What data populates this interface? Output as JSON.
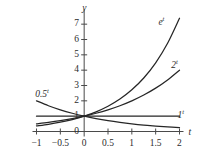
{
  "chart_data": {
    "type": "line",
    "title": "",
    "subtitle": "",
    "xlabel": "t",
    "ylabel": "y",
    "xlim": [
      -1,
      2
    ],
    "ylim": [
      0,
      7.5
    ],
    "grid": false,
    "legend_position": "inline-curve-labels",
    "xticks": [
      -1,
      -0.5,
      0,
      0.5,
      1,
      1.5,
      2
    ],
    "xtick_labels": [
      "−1",
      "−0.5",
      "0",
      "0.5",
      "1",
      "1.5",
      "2"
    ],
    "yticks": [
      0,
      1,
      2,
      3,
      4,
      5,
      6,
      7
    ],
    "ytick_labels": [
      "0",
      "1",
      "2",
      "3",
      "4",
      "5",
      "6",
      "7"
    ],
    "series": [
      {
        "name": "e^t",
        "label_base": "e",
        "label_exponent": "t",
        "color": "#262626",
        "label_x": 1.62,
        "label_y": 7.05,
        "x": [
          -1,
          -0.75,
          -0.5,
          -0.25,
          0,
          0.25,
          0.5,
          0.75,
          1,
          1.25,
          1.5,
          1.75,
          2
        ],
        "y": [
          0.368,
          0.472,
          0.607,
          0.779,
          1.0,
          1.284,
          1.649,
          2.117,
          2.718,
          3.49,
          4.482,
          5.755,
          7.389
        ]
      },
      {
        "name": "2^t",
        "label_base": "2",
        "label_exponent": "t",
        "color": "#262626",
        "label_x": 1.9,
        "label_y": 4.25,
        "x": [
          -1,
          -0.75,
          -0.5,
          -0.25,
          0,
          0.25,
          0.5,
          0.75,
          1,
          1.25,
          1.5,
          1.75,
          2
        ],
        "y": [
          0.5,
          0.595,
          0.707,
          0.841,
          1.0,
          1.189,
          1.414,
          1.682,
          2.0,
          2.378,
          2.828,
          3.364,
          4.0
        ]
      },
      {
        "name": "1^t",
        "label_base": "1",
        "label_exponent": "t",
        "color": "#262626",
        "label_x": 2.03,
        "label_y": 1.0,
        "x": [
          -1,
          2
        ],
        "y": [
          1.0,
          1.0
        ]
      },
      {
        "name": "0.5^t",
        "label_base": "0.5",
        "label_exponent": "t",
        "color": "#262626",
        "label_x": -0.88,
        "label_y": 2.35,
        "x": [
          -1,
          -0.75,
          -0.5,
          -0.25,
          0,
          0.25,
          0.5,
          0.75,
          1,
          1.25,
          1.5,
          1.75,
          2
        ],
        "y": [
          2.0,
          1.682,
          1.414,
          1.189,
          1.0,
          0.841,
          0.707,
          0.595,
          0.5,
          0.42,
          0.354,
          0.297,
          0.25
        ]
      }
    ]
  },
  "axes": {
    "y_axis_name": "y",
    "x_axis_name": "t"
  }
}
